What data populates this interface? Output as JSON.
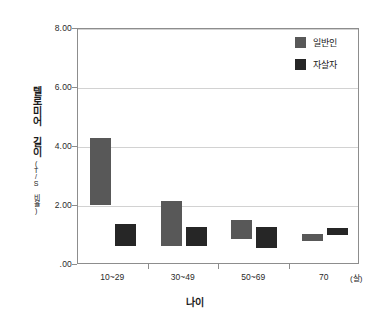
{
  "chart_data": {
    "type": "bar",
    "bar_style": "floating-range",
    "title": "",
    "xlabel": "나이",
    "ylabel": "텔로미어 길이",
    "ylabel_sub": "(T/S 비율)",
    "xunit": "(살)",
    "categories": [
      "10~29",
      "30~49",
      "50~69",
      "70"
    ],
    "ylim": [
      0,
      8
    ],
    "yticks": [
      0,
      2,
      4,
      6,
      8
    ],
    "ytick_labels": [
      ".00",
      "2.00",
      "4.00",
      "6.00",
      "8.00"
    ],
    "grid": true,
    "legend_position": "top-right",
    "series": [
      {
        "name": "일반인",
        "color": "#585858",
        "ranges": [
          {
            "category": "10~29",
            "low": 2.03,
            "high": 4.3
          },
          {
            "category": "30~49",
            "low": 0.63,
            "high": 2.17
          },
          {
            "category": "50~69",
            "low": 0.88,
            "high": 1.53
          },
          {
            "category": "70",
            "low": 0.8,
            "high": 1.05
          }
        ]
      },
      {
        "name": "자살자",
        "color": "#262626",
        "ranges": [
          {
            "category": "10~29",
            "low": 0.63,
            "high": 1.38
          },
          {
            "category": "30~49",
            "low": 0.63,
            "high": 1.28
          },
          {
            "category": "50~69",
            "low": 0.58,
            "high": 1.28
          },
          {
            "category": "70",
            "low": 1.03,
            "high": 1.25
          }
        ]
      }
    ]
  },
  "legend": {
    "items": [
      {
        "label": "일반인",
        "color": "#585858"
      },
      {
        "label": "자살자",
        "color": "#262626"
      }
    ]
  },
  "axes": {
    "y_title_main": "텔로미어 길이",
    "y_title_sub": "(T/S 비율)",
    "x_title": "나이",
    "x_unit": "(살)"
  },
  "colors": {
    "general": "#585858",
    "suicide": "#262626",
    "grid": "#d2d2d2",
    "axis": "#8d8d8d",
    "background": "#ffffff"
  }
}
